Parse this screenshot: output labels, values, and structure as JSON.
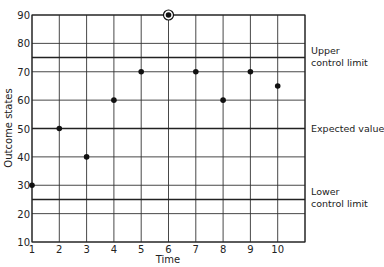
{
  "chart_data": {
    "type": "scatter",
    "title": "",
    "xlabel": "Time",
    "ylabel": "Outcome states",
    "xlim": [
      1,
      11
    ],
    "ylim": [
      10,
      90
    ],
    "x_ticks": [
      1,
      2,
      3,
      4,
      5,
      6,
      7,
      8,
      9,
      10
    ],
    "y_ticks": [
      10,
      20,
      30,
      40,
      50,
      60,
      70,
      80,
      90
    ],
    "grid": true,
    "series": [
      {
        "name": "Outcome states",
        "points": [
          {
            "x": 1,
            "y": 30
          },
          {
            "x": 2,
            "y": 50
          },
          {
            "x": 3,
            "y": 40
          },
          {
            "x": 4,
            "y": 60
          },
          {
            "x": 5,
            "y": 70
          },
          {
            "x": 6,
            "y": 90,
            "circled": true
          },
          {
            "x": 7,
            "y": 70
          },
          {
            "x": 8,
            "y": 60
          },
          {
            "x": 9,
            "y": 70
          },
          {
            "x": 10,
            "y": 65
          }
        ]
      }
    ],
    "reference_lines": [
      {
        "name": "upper-control-limit",
        "y": 75,
        "label_lines": [
          "Upper",
          "control limit"
        ]
      },
      {
        "name": "expected-value",
        "y": 50,
        "label_lines": [
          "Expected value"
        ]
      },
      {
        "name": "lower-control-limit",
        "y": 25,
        "label_lines": [
          "Lower",
          "control limit"
        ]
      }
    ]
  },
  "style": {
    "line_color": "#222222",
    "grid_color": "#333333",
    "point_color": "#111111",
    "background": "#ffffff"
  }
}
